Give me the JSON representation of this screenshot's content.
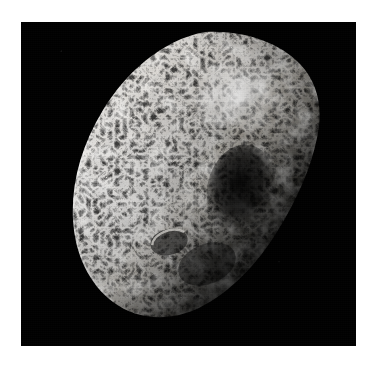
{
  "image": {
    "subject": "hyperion-moon",
    "caption": "",
    "background_color": "#000000",
    "border_color": "#ffffff",
    "frame": {
      "x": 21,
      "y": 22,
      "width": 335,
      "height": 324
    },
    "palette": {
      "sky": "#000000",
      "highlight": "#f2f0ec",
      "bright_terrain": "#d7d3cc",
      "mid_terrain": "#9a958d",
      "shadow_terrain": "#4a4845",
      "deep_shadow": "#141312",
      "terminator": "#050505"
    },
    "lighting": {
      "sun_direction": "upper-left",
      "terminator_side": "lower-right"
    },
    "body": {
      "name": "hyperion",
      "shape": "irregular-ellipsoid",
      "surface": "sponge-like heavily cratered regolith",
      "center": {
        "x": 170,
        "y": 180
      },
      "long_axis_tilt_deg": -28
    },
    "features": [
      {
        "name": "bright-limb-west",
        "x": 75,
        "y": 190,
        "size": 70,
        "tone": "highlight"
      },
      {
        "name": "bright-crater-ray-north",
        "x": 215,
        "y": 100,
        "size": 56,
        "tone": "highlight"
      },
      {
        "name": "large-dark-crater-center",
        "x": 218,
        "y": 195,
        "size": 58,
        "tone": "deep_shadow"
      },
      {
        "name": "rimmed-crater-southwest",
        "x": 148,
        "y": 247,
        "size": 30,
        "tone": "mid_terrain"
      },
      {
        "name": "shadowed-terminator-east",
        "x": 290,
        "y": 250,
        "size": 120,
        "tone": "terminator"
      }
    ]
  }
}
